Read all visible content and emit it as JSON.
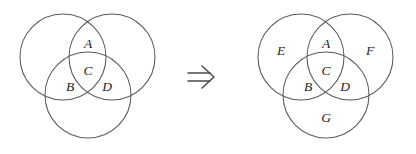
{
  "figure": {
    "kind": "venn-diagram-transformation",
    "background_color": "#ffffff",
    "stroke_color": "#59595b",
    "label_color": "#1d1d1f",
    "relation_symbol": "⟹",
    "relation_symbol_name": "double-right-arrow"
  },
  "left_diagram": {
    "name": "three-circle-venn-before",
    "circle_radius": 43,
    "circles": [
      {
        "id": "left-upper-left-circle",
        "cx": 63,
        "cy": 57
      },
      {
        "id": "left-upper-right-circle",
        "cx": 112,
        "cy": 57
      },
      {
        "id": "left-bottom-circle",
        "cx": 88,
        "cy": 95
      }
    ],
    "labels": [
      {
        "id": "label-A",
        "text": "A",
        "x": 88,
        "y": 45
      },
      {
        "id": "label-C",
        "text": "C",
        "x": 88,
        "y": 72
      },
      {
        "id": "label-B",
        "text": "B",
        "x": 70,
        "y": 88
      },
      {
        "id": "label-D",
        "text": "D",
        "x": 107,
        "y": 88
      }
    ]
  },
  "right_diagram": {
    "name": "three-circle-venn-after",
    "circle_radius": 43,
    "circles": [
      {
        "id": "right-upper-left-circle",
        "cx": 301,
        "cy": 57
      },
      {
        "id": "right-upper-right-circle",
        "cx": 350,
        "cy": 57
      },
      {
        "id": "right-bottom-circle",
        "cx": 326,
        "cy": 95
      }
    ],
    "labels": [
      {
        "id": "label-E",
        "text": "E",
        "x": 281,
        "y": 52
      },
      {
        "id": "label-A",
        "text": "A",
        "x": 326,
        "y": 45
      },
      {
        "id": "label-F",
        "text": "F",
        "x": 370,
        "y": 52
      },
      {
        "id": "label-C",
        "text": "C",
        "x": 326,
        "y": 72
      },
      {
        "id": "label-B",
        "text": "B",
        "x": 308,
        "y": 88
      },
      {
        "id": "label-D",
        "text": "D",
        "x": 345,
        "y": 88
      },
      {
        "id": "label-G",
        "text": "G",
        "x": 326,
        "y": 119
      }
    ]
  },
  "arrow": {
    "name": "implies-arrow",
    "x": 190,
    "y": 77,
    "label": "⟹"
  }
}
